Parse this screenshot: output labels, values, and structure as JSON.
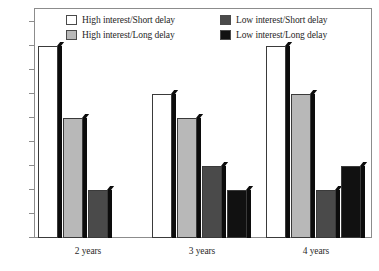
{
  "chart_data": {
    "type": "bar",
    "title": "",
    "subtitle": "",
    "xlabel": "",
    "ylabel": "",
    "categories": [
      "2 years",
      "3 years",
      "4 years"
    ],
    "series": [
      {
        "name": "High interest/Short delay",
        "color": "#ffffff",
        "values": [
          0.8,
          0.6,
          0.8
        ]
      },
      {
        "name": "High interest/Long delay",
        "color": "#b8b8b8",
        "values": [
          0.5,
          0.5,
          0.6
        ]
      },
      {
        "name": "Low interest/Short delay",
        "color": "#4a4a4a",
        "values": [
          0.2,
          0.3,
          0.2
        ]
      },
      {
        "name": "Low interest/Long delay",
        "color": "#111111",
        "values": [
          0.0,
          0.2,
          0.3
        ]
      }
    ],
    "ylim": [
      0,
      0.9
    ],
    "ytick_labels": [
      "0",
      "0.1",
      "0.2",
      "0.3",
      "0.4",
      "0.5",
      "0.6",
      "0.7",
      "0.8",
      "0.9"
    ],
    "ytick_values": [
      0,
      0.1,
      0.2,
      0.3,
      0.4,
      0.5,
      0.6,
      0.7,
      0.8,
      0.9
    ],
    "grid": false,
    "legend_position": "top-inside",
    "bar_style": "3d-shadow"
  },
  "axes": {
    "y_ticks": [
      {
        "label": "0.9",
        "value": 0.9
      },
      {
        "label": "0.8",
        "value": 0.8
      },
      {
        "label": "0.7",
        "value": 0.7
      },
      {
        "label": "0.6",
        "value": 0.6
      },
      {
        "label": "0.5",
        "value": 0.5
      },
      {
        "label": "0.4",
        "value": 0.4
      },
      {
        "label": "0.3",
        "value": 0.3
      },
      {
        "label": "0.2",
        "value": 0.2
      },
      {
        "label": "0.1",
        "value": 0.1
      },
      {
        "label": "0",
        "value": 0
      }
    ],
    "x_categories": [
      {
        "label": "2 years"
      },
      {
        "label": "3 years"
      },
      {
        "label": "4 years"
      }
    ]
  },
  "legend": {
    "rows": [
      {
        "entries": [
          {
            "label": "High interest/Short delay",
            "color": "#ffffff"
          },
          {
            "label": "Low interest/Short delay",
            "color": "#4a4a4a"
          }
        ]
      },
      {
        "entries": [
          {
            "label": "High interest/Long delay",
            "color": "#b8b8b8"
          },
          {
            "label": "Low interest/Long delay",
            "color": "#111111"
          }
        ]
      }
    ]
  },
  "colors": {
    "series_white": "#ffffff",
    "series_light_gray": "#b8b8b8",
    "series_dark_gray": "#4a4a4a",
    "series_black": "#111111",
    "shadow": "#0c0c0c",
    "frame": "#8c8c8c",
    "text": "#1f1f1f",
    "background": "#ffffff"
  }
}
